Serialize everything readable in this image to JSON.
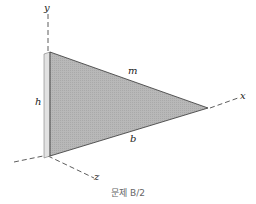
{
  "figure": {
    "axes": {
      "x": "x",
      "y": "y",
      "z": "z"
    },
    "dimensions": {
      "height": "h",
      "base": "b",
      "mass": "m"
    },
    "caption": "문제 B/2",
    "colors": {
      "plate_face": "#b4b4b4",
      "plate_edge": "#e2e2e2",
      "line": "#333333",
      "caption": "#666666"
    }
  }
}
